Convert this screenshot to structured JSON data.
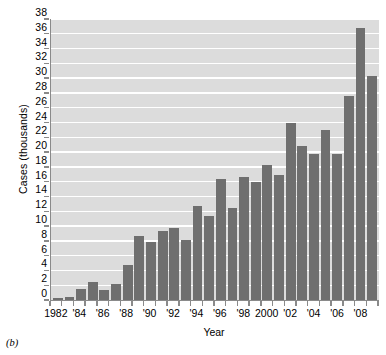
{
  "figure": {
    "caption": "(b)"
  },
  "chart_data": {
    "type": "bar",
    "title": "",
    "xlabel": "Year",
    "ylabel": "Cases (thousands)",
    "ylim": [
      0,
      38
    ],
    "ytick_step": 2,
    "grid": true,
    "legend": null,
    "bar_color": "#6f6f6f",
    "plot_background": "#dcdcdc",
    "gridline_color": "#ffffff",
    "axis_color": "#8a8a8a",
    "yticks": [
      38,
      36,
      34,
      32,
      30,
      28,
      26,
      24,
      22,
      20,
      18,
      16,
      14,
      12,
      10,
      8,
      6,
      4,
      2,
      0
    ],
    "xtick_labels": [
      "1982",
      "'84",
      "'86",
      "'88",
      "'90",
      "'92",
      "'94",
      "'96",
      "'98",
      "2000",
      "'02",
      "'04",
      "'06",
      "'08"
    ],
    "xtick_years": [
      1982,
      1984,
      1986,
      1988,
      1990,
      1992,
      1994,
      1996,
      1998,
      2000,
      2002,
      2004,
      2006,
      2008
    ],
    "categories": [
      1982,
      1983,
      1984,
      1985,
      1986,
      1987,
      1988,
      1989,
      1990,
      1991,
      1992,
      1993,
      1994,
      1995,
      1996,
      1997,
      1998,
      1999,
      2000,
      2001,
      2002,
      2003,
      2004,
      2005,
      2006,
      2007,
      2008,
      2009
    ],
    "values": [
      0.3,
      0.4,
      1.5,
      2.5,
      1.3,
      2.2,
      4.7,
      8.7,
      7.9,
      9.3,
      9.8,
      8.1,
      12.7,
      11.4,
      16.3,
      12.5,
      16.6,
      16.0,
      18.2,
      16.9,
      23.9,
      20.8,
      19.7,
      23.0,
      19.8,
      27.6,
      36.8,
      30.3
    ]
  }
}
